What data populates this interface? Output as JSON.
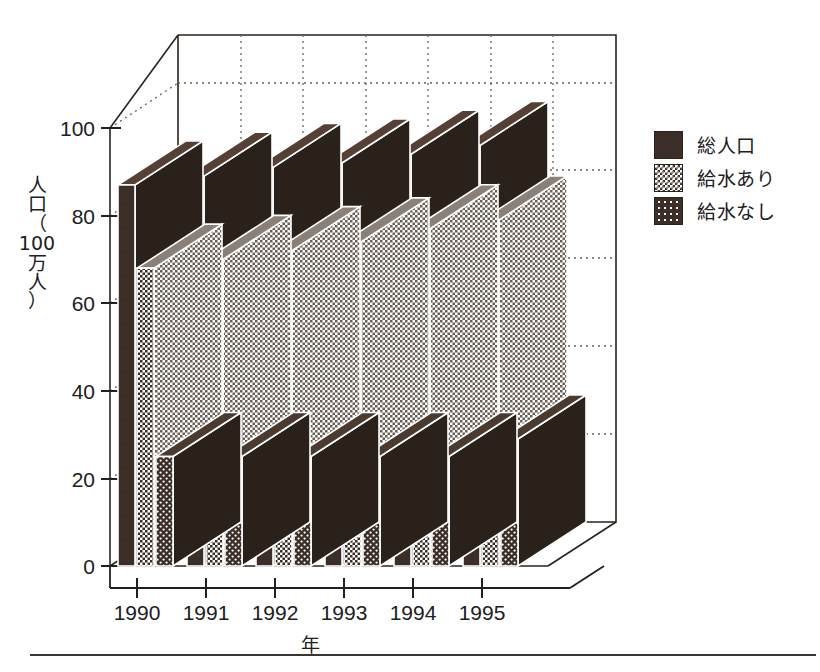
{
  "chart_data": {
    "type": "bar",
    "title": "",
    "xlabel": "年",
    "ylabel": "人口（100万人）",
    "ylabel_chars": [
      "人",
      "口",
      "（",
      "100",
      "万",
      "人",
      "）"
    ],
    "categories": [
      "1990",
      "1991",
      "1992",
      "1993",
      "1994",
      "1995"
    ],
    "ylim": [
      0,
      100
    ],
    "yticks": [
      0,
      20,
      40,
      60,
      80,
      100
    ],
    "ytick_labels": [
      "0",
      "20",
      "40",
      "60",
      "80",
      "100"
    ],
    "grid": true,
    "legend_position": "right",
    "projection": "3d",
    "series": [
      {
        "name": "総人口",
        "pattern": "solid",
        "values": [
          87,
          89,
          91,
          92,
          94,
          96
        ]
      },
      {
        "name": "給水あり",
        "pattern": "check",
        "values": [
          68,
          70,
          72,
          74,
          77,
          79
        ]
      },
      {
        "name": "給水なし",
        "pattern": "dots",
        "values": [
          25,
          25,
          25,
          25,
          25,
          29
        ]
      }
    ],
    "colors": {
      "ink": "#3a2e26",
      "axis": "#20201e",
      "grid": "#6b6159",
      "background": "#ffffff",
      "check_light": "#ffffff",
      "dots_light": "#ffffff"
    }
  },
  "axis": {
    "y_label_lines": [
      "人",
      "口",
      "（",
      "100",
      "万",
      "人",
      "）"
    ],
    "x_label": "年",
    "y_ticks": [
      "100",
      "80",
      "60",
      "40",
      "20",
      "0"
    ],
    "x_ticks": [
      "1990",
      "1991",
      "1992",
      "1993",
      "1994",
      "1995"
    ]
  },
  "legend": {
    "items": [
      {
        "label": "総人口",
        "swatch": "solid-dark-swatch"
      },
      {
        "label": "給水あり",
        "swatch": "checker-grey-swatch"
      },
      {
        "label": "給水なし",
        "swatch": "dotted-dark-swatch"
      }
    ]
  }
}
